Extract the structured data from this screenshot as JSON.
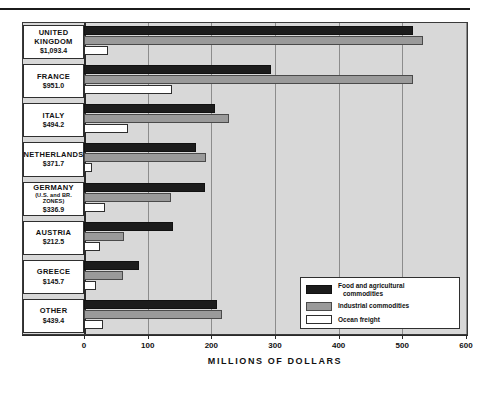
{
  "chart_data": {
    "type": "bar",
    "title": "",
    "orientation": "horizontal",
    "grouped": true,
    "xlabel": "MILLIONS OF DOLLARS",
    "ylabel": "",
    "xlim": [
      0,
      600
    ],
    "xticks": [
      0,
      100,
      200,
      300,
      400,
      500,
      600
    ],
    "xtick_labels": [
      "0",
      "100",
      "200",
      "300",
      "400",
      "500",
      "600"
    ],
    "grid": true,
    "legend_position": "bottom-right",
    "categories": [
      "UNITED KINGDOM",
      "FRANCE",
      "ITALY",
      "NETHERLANDS",
      "GERMANY",
      "AUSTRIA",
      "GREECE",
      "OTHER"
    ],
    "category_totals": [
      "$1,093.4",
      "$951.0",
      "$494.2",
      "$371.7",
      "$336.9",
      "$212.5",
      "$145.7",
      "$439.4"
    ],
    "series": [
      {
        "name": "Food and agricultural commodities",
        "color": "#1c1c1c",
        "values": [
          517,
          293,
          206,
          176,
          190,
          140,
          87,
          209
        ]
      },
      {
        "name": "Industrial commodities",
        "color": "#9a9a9a",
        "values": [
          532,
          517,
          227,
          192,
          137,
          63,
          61,
          217
        ]
      },
      {
        "name": "Ocean freight",
        "color": "#ffffff",
        "values": [
          37,
          139,
          69,
          13,
          33,
          25,
          19,
          30
        ]
      }
    ]
  },
  "rows": [
    {
      "name": "UNITED",
      "name2": "KINGDOM",
      "sub": "",
      "value": "$1,093.4"
    },
    {
      "name": "FRANCE",
      "name2": "",
      "sub": "",
      "value": "$951.0"
    },
    {
      "name": "ITALY",
      "name2": "",
      "sub": "",
      "value": "$494.2"
    },
    {
      "name": "NETHERLANDS",
      "name2": "",
      "sub": "",
      "value": "$371.7"
    },
    {
      "name": "GERMANY",
      "name2": "",
      "sub": "(U.S. and BR. ZONES)",
      "value": "$336.9"
    },
    {
      "name": "AUSTRIA",
      "name2": "",
      "sub": "",
      "value": "$212.5"
    },
    {
      "name": "GREECE",
      "name2": "",
      "sub": "",
      "value": "$145.7"
    },
    {
      "name": "OTHER",
      "name2": "",
      "sub": "",
      "value": "$439.4"
    }
  ],
  "legend": {
    "items": [
      {
        "key": "food",
        "line1": "Food and agricultural",
        "line2": "commodities"
      },
      {
        "key": "ind",
        "line1": "Industrial  commodities",
        "line2": ""
      },
      {
        "key": "freight",
        "line1": "Ocean freight",
        "line2": ""
      }
    ]
  },
  "axis": {
    "title": "MILLIONS OF DOLLARS",
    "ticks": [
      "0",
      "100",
      "200",
      "300",
      "400",
      "500",
      "600"
    ]
  },
  "colors": {
    "food": "#1c1c1c",
    "industrial": "#9a9a9a",
    "freight": "#ffffff",
    "plot_background": "#d8d8d8",
    "frame": "#3a3a3a"
  },
  "footer_fragment": ""
}
